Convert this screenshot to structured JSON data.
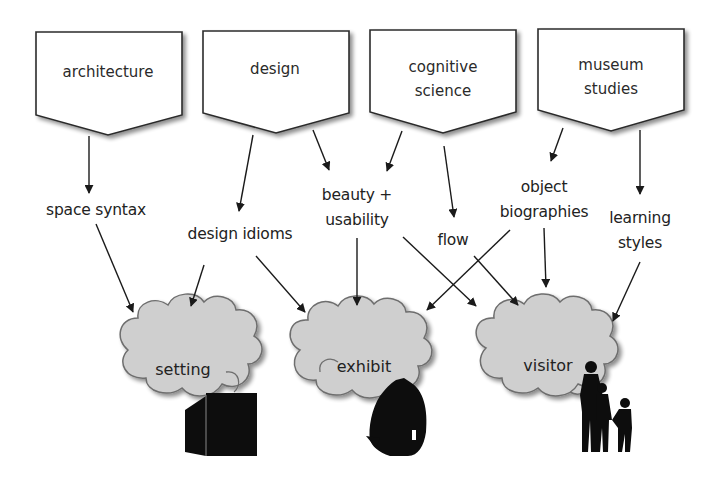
{
  "diagram": {
    "disciplines": [
      {
        "id": "architecture",
        "label": "architecture"
      },
      {
        "id": "design",
        "label": "design"
      },
      {
        "id": "cognitive-science",
        "label": "cognitive science",
        "lines": [
          "cognitive",
          "science"
        ]
      },
      {
        "id": "museum-studies",
        "label": "museum studies",
        "lines": [
          "museum",
          "studies"
        ]
      }
    ],
    "concepts": [
      {
        "id": "space-syntax",
        "label": "space syntax"
      },
      {
        "id": "design-idioms",
        "label": "design idioms"
      },
      {
        "id": "beauty-usability",
        "label": "beauty + usability",
        "lines": [
          "beauty +",
          "usability"
        ]
      },
      {
        "id": "flow",
        "label": "flow"
      },
      {
        "id": "object-biographies",
        "label": "object biographies",
        "lines": [
          "object",
          "biographies"
        ]
      },
      {
        "id": "learning-styles",
        "label": "learning styles",
        "lines": [
          "learning",
          "styles"
        ]
      }
    ],
    "targets": [
      {
        "id": "setting",
        "label": "setting",
        "icon": "cube-icon"
      },
      {
        "id": "exhibit",
        "label": "exhibit",
        "icon": "helmet-icon"
      },
      {
        "id": "visitor",
        "label": "visitor",
        "icon": "family-silhouette-icon"
      }
    ],
    "edges": [
      {
        "from": "architecture",
        "to": "space-syntax"
      },
      {
        "from": "design",
        "to": "design-idioms"
      },
      {
        "from": "design",
        "to": "beauty-usability"
      },
      {
        "from": "cognitive-science",
        "to": "beauty-usability"
      },
      {
        "from": "cognitive-science",
        "to": "flow"
      },
      {
        "from": "museum-studies",
        "to": "object-biographies"
      },
      {
        "from": "museum-studies",
        "to": "learning-styles"
      },
      {
        "from": "space-syntax",
        "to": "setting"
      },
      {
        "from": "design-idioms",
        "to": "setting"
      },
      {
        "from": "design-idioms",
        "to": "exhibit"
      },
      {
        "from": "beauty-usability",
        "to": "exhibit"
      },
      {
        "from": "beauty-usability",
        "to": "visitor"
      },
      {
        "from": "object-biographies",
        "to": "exhibit"
      },
      {
        "from": "object-biographies",
        "to": "visitor"
      },
      {
        "from": "flow",
        "to": "visitor"
      },
      {
        "from": "learning-styles",
        "to": "visitor"
      }
    ],
    "colors": {
      "box_stroke": "#2b2b2b",
      "box_fill": "#ffffff",
      "cloud_fill": "#cfcfcf",
      "cloud_stroke": "#6e6e6e",
      "arrow": "#1a1a1a",
      "silhouette": "#0d0d0d"
    }
  }
}
